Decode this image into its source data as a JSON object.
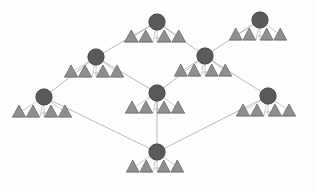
{
  "diagram": {
    "type": "node-link-lattice",
    "background_color": "#fefefe",
    "node_color": "#5a5a5a",
    "node_stroke_color": "#4a4a4a",
    "edge_color": "#a9a9a9",
    "leaf_fill_color": "#8f8f8f",
    "leaf_stroke_color": "#6b6b6b",
    "leaf_baseline_color": "#8a8a8a",
    "node_radius": 7.5,
    "nodes": [
      {
        "id": "n1",
        "label": "",
        "x": 157,
        "y": 22,
        "leaf_clusters": 2,
        "leaves_per_cluster": 2,
        "leaf_y": 42,
        "leaf_span": 66
      },
      {
        "id": "n2",
        "label": "",
        "x": 260,
        "y": 20,
        "leaf_clusters": 2,
        "leaves_per_cluster": 2,
        "leaf_y": 40,
        "leaf_span": 62
      },
      {
        "id": "n3",
        "label": "",
        "x": 96,
        "y": 57,
        "leaf_clusters": 2,
        "leaves_per_cluster": 2,
        "leaf_y": 77,
        "leaf_span": 64
      },
      {
        "id": "n4",
        "label": "",
        "x": 205,
        "y": 56,
        "leaf_clusters": 2,
        "leaves_per_cluster": 2,
        "leaf_y": 76,
        "leaf_span": 62
      },
      {
        "id": "n5",
        "label": "",
        "x": 44,
        "y": 97,
        "leaf_clusters": 2,
        "leaves_per_cluster": 2,
        "leaf_y": 117,
        "leaf_span": 64
      },
      {
        "id": "n6",
        "label": "",
        "x": 157,
        "y": 93,
        "leaf_clusters": 2,
        "leaves_per_cluster": 2,
        "leaf_y": 113,
        "leaf_span": 64
      },
      {
        "id": "n7",
        "label": "",
        "x": 268,
        "y": 96,
        "leaf_clusters": 2,
        "leaves_per_cluster": 2,
        "leaf_y": 116,
        "leaf_span": 64
      },
      {
        "id": "n8",
        "label": "",
        "x": 157,
        "y": 152,
        "leaf_clusters": 2,
        "leaves_per_cluster": 2,
        "leaf_y": 172,
        "leaf_span": 62
      }
    ],
    "edges": [
      {
        "from": "n1",
        "to": "n3"
      },
      {
        "from": "n1",
        "to": "n4"
      },
      {
        "from": "n2",
        "to": "n4"
      },
      {
        "from": "n3",
        "to": "n5"
      },
      {
        "from": "n3",
        "to": "n6"
      },
      {
        "from": "n4",
        "to": "n6"
      },
      {
        "from": "n4",
        "to": "n7"
      },
      {
        "from": "n5",
        "to": "n8"
      },
      {
        "from": "n6",
        "to": "n8"
      },
      {
        "from": "n7",
        "to": "n8"
      }
    ]
  }
}
